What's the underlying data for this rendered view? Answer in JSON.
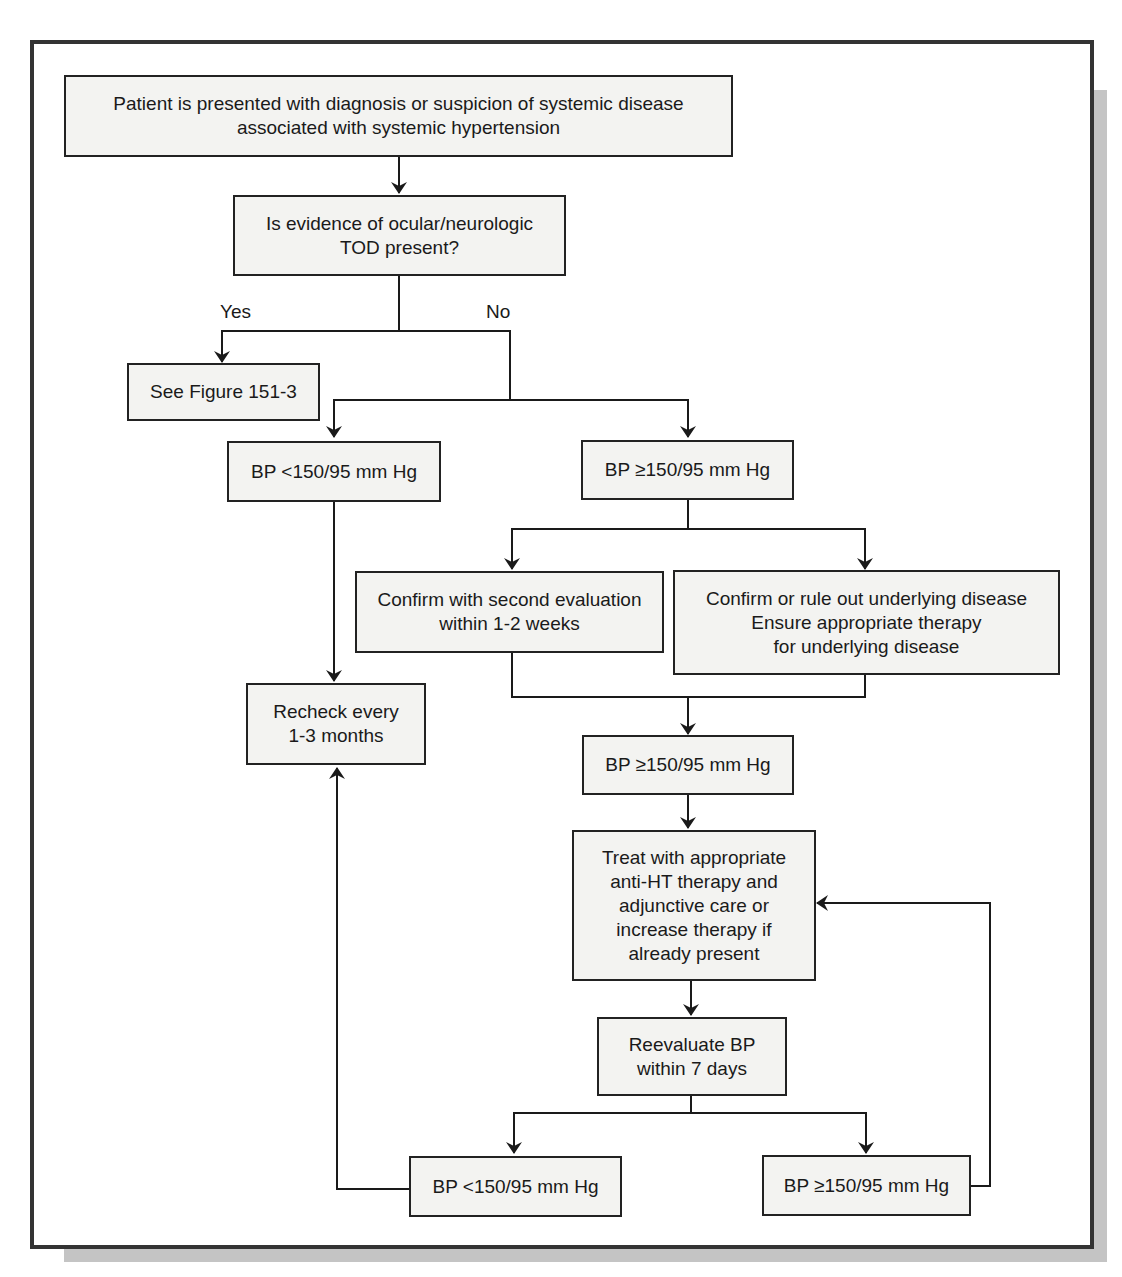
{
  "figure": {
    "colors": {
      "frame": "#333333",
      "shadow": "#c4c4c4",
      "box_fill": "#f3f3f1",
      "line": "#1a1a1a"
    }
  },
  "nodes": {
    "start": "Patient is presented with diagnosis or suspicion of systemic disease\nassociated with systemic hypertension",
    "tod_question": "Is evidence of ocular/neurologic\nTOD present?",
    "see_figure": "See Figure 151-3",
    "bp_low_1": "BP <150/95 mm Hg",
    "bp_high_1": "BP ≥150/95 mm Hg",
    "confirm_second": "Confirm with second evaluation\nwithin 1-2 weeks",
    "confirm_underlying": "Confirm or rule out underlying disease\nEnsure appropriate therapy\nfor underlying disease",
    "recheck": "Recheck every\n1-3 months",
    "bp_high_2": "BP ≥150/95 mm Hg",
    "treat": "Treat with appropriate\nanti-HT therapy and\nadjunctive care or\nincrease therapy if\nalready present",
    "reevaluate": "Reevaluate BP\nwithin 7 days",
    "bp_low_2": "BP <150/95 mm Hg",
    "bp_high_3": "BP ≥150/95 mm Hg"
  },
  "edge_labels": {
    "yes": "Yes",
    "no": "No"
  }
}
